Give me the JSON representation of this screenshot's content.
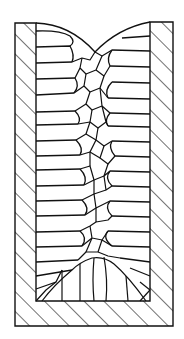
{
  "diagram": {
    "title": "Ingot solidification grain structure in mold",
    "zones": [
      {
        "name": "chill-zone",
        "description": "fine equiaxed grains at mold wall"
      },
      {
        "name": "columnar-zone",
        "description": "elongated columnar grains growing inward from walls"
      },
      {
        "name": "equiaxed-zone",
        "description": "central equiaxed grains"
      },
      {
        "name": "bottom-cone",
        "description": "columnar grains growing up from mold base"
      }
    ],
    "mold": {
      "outer": {
        "x": 15,
        "y": 22,
        "right": 173,
        "bottom": 326
      },
      "inner": {
        "x": 36,
        "right": 150,
        "bottom": 301
      },
      "wall_fill": "hatched"
    },
    "colors": {
      "ink": "#111111",
      "paper": "#ffffff"
    }
  }
}
